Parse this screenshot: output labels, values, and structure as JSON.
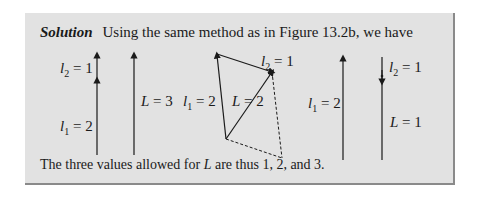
{
  "solution": {
    "label": "Solution",
    "intro": "Using the same method as in Figure 13.2b, we have"
  },
  "diagram": {
    "panel1": {
      "top_label": "l₂ = 1",
      "bottom_label": "l₁ = 2"
    },
    "panel2": {
      "label": "L = 3"
    },
    "panel3": {
      "left_label": "l₁ = 2",
      "middle_label": "L = 2",
      "top_label": "l₂ = 1"
    },
    "panel4": {
      "label": "l₁ = 2"
    },
    "panel5": {
      "top_label": "l₂ = 1",
      "bottom_label": "L = 1"
    }
  },
  "conclusion": {
    "prefix": "The three values allowed for ",
    "variable": "L",
    "suffix": " are thus 1, 2, and 3."
  },
  "colors": {
    "box_background": "#e2e2e2",
    "box_shadow": "#8a8a8a",
    "ink": "#1a1a1a"
  }
}
